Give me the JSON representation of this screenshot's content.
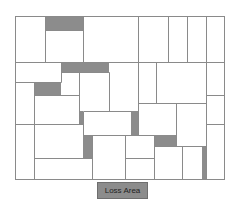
{
  "diagram": {
    "type": "rectangle-packing-layout",
    "frame": {
      "x": 15,
      "y": 16,
      "w": 209,
      "h": 163
    },
    "colors": {
      "line": "#8a8a8a",
      "loss": "#8c8c8c",
      "background": "#ffffff"
    },
    "lines": [
      [
        15,
        62,
        224,
        62
      ],
      [
        45,
        16,
        45,
        62
      ],
      [
        83,
        16,
        83,
        62
      ],
      [
        138,
        16,
        138,
        62
      ],
      [
        168,
        16,
        168,
        62
      ],
      [
        187,
        16,
        187,
        62
      ],
      [
        206,
        16,
        206,
        62
      ],
      [
        45,
        30,
        83,
        30
      ],
      [
        15,
        82,
        61,
        82
      ],
      [
        61,
        62,
        61,
        82
      ],
      [
        61,
        72,
        109,
        72
      ],
      [
        34,
        82,
        34,
        179
      ],
      [
        34,
        95,
        79,
        95
      ],
      [
        79,
        72,
        79,
        124
      ],
      [
        109,
        72,
        109,
        111
      ],
      [
        15,
        124,
        83,
        124
      ],
      [
        83,
        111,
        131,
        111
      ],
      [
        83,
        111,
        83,
        135
      ],
      [
        83,
        135,
        131,
        135
      ],
      [
        138,
        62,
        138,
        135
      ],
      [
        156,
        62,
        156,
        103
      ],
      [
        138,
        103,
        206,
        103
      ],
      [
        206,
        62,
        206,
        179
      ],
      [
        206,
        95,
        224,
        95
      ],
      [
        206,
        124,
        224,
        124
      ],
      [
        176,
        103,
        176,
        146
      ],
      [
        92,
        135,
        92,
        179
      ],
      [
        34,
        158,
        92,
        158
      ],
      [
        125,
        135,
        125,
        179
      ],
      [
        125,
        135,
        154,
        135
      ],
      [
        125,
        158,
        154,
        158
      ],
      [
        154,
        135,
        154,
        179
      ],
      [
        154,
        146,
        206,
        146
      ],
      [
        182,
        146,
        182,
        179
      ]
    ],
    "loss_areas": [
      {
        "x": 45,
        "y": 16,
        "w": 38,
        "h": 14
      },
      {
        "x": 61,
        "y": 62,
        "w": 48,
        "h": 10
      },
      {
        "x": 34,
        "y": 82,
        "w": 27,
        "h": 13
      },
      {
        "x": 79,
        "y": 111,
        "w": 4,
        "h": 13
      },
      {
        "x": 131,
        "y": 111,
        "w": 7,
        "h": 24
      },
      {
        "x": 83,
        "y": 135,
        "w": 9,
        "h": 23
      },
      {
        "x": 154,
        "y": 135,
        "w": 22,
        "h": 11
      },
      {
        "x": 202,
        "y": 146,
        "w": 4,
        "h": 33
      }
    ]
  },
  "legend": {
    "label": "Loss Area",
    "swatch_color": "#8c8c8c"
  }
}
